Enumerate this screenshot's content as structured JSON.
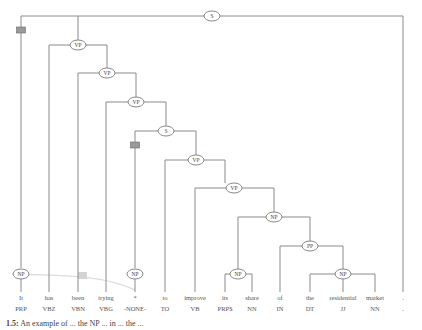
{
  "diagram": {
    "type": "constituency-parse-tree",
    "root_label": "S",
    "nodes": {
      "s_root": "S",
      "vp1": "VP",
      "vp2": "VP",
      "vp3": "VP",
      "s_embedded": "S",
      "vp4": "VP",
      "vp5": "VP",
      "np_object": "NP",
      "pp": "PP",
      "np_its_share": "NP",
      "np_the_residential_market": "NP",
      "np_subject": "NP",
      "np_trace": "NP"
    },
    "leaves": [
      {
        "word": "It",
        "tag": "PRP"
      },
      {
        "word": "has",
        "tag": "VBZ"
      },
      {
        "word": "been",
        "tag": "VBN"
      },
      {
        "word": "trying",
        "tag": "VBG"
      },
      {
        "word": "*",
        "tag": "-NONE-"
      },
      {
        "word": "to",
        "tag": "TO"
      },
      {
        "word": "improve",
        "tag": "VB"
      },
      {
        "word": "its",
        "tag": "PRP$"
      },
      {
        "word": "share",
        "tag": "NN"
      },
      {
        "word": "of",
        "tag": "IN"
      },
      {
        "word": "the",
        "tag": "DT"
      },
      {
        "word": "residential",
        "tag": "JJ"
      },
      {
        "word": "market",
        "tag": "NN"
      },
      {
        "word": ".",
        "tag": "."
      }
    ],
    "trace_link": {
      "from": "NP (It)",
      "to": "NP (*)"
    },
    "colors": {
      "edge": "#8a8a8a",
      "marker_box": "#9a9a9a",
      "trace": "#dcdcdc"
    }
  },
  "caption": {
    "number": "1.5:",
    "text": "An example of ... the NP ... in ... the ..."
  }
}
